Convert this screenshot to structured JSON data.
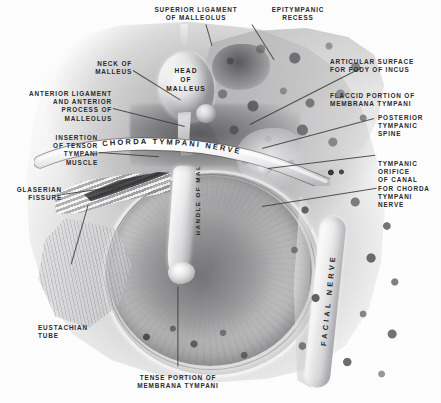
{
  "plate": {
    "title": "Tympanic membrane and ossicles — inner view of right tympanic cavity",
    "medium": "grayscale anatomical engraving",
    "width": 441,
    "height": 403,
    "background_color": "#ffffff",
    "label_color": "#2b2b2b",
    "leader_color": "#3a3a3a"
  },
  "labels": [
    {
      "id": "superior-ligament-of-malleolus",
      "text": "SUPERIOR LIGAMENT\nOF MALLEOLUS",
      "align": "center"
    },
    {
      "id": "epitympanic-recess",
      "text": "EPITYMPANIC\nRECESS",
      "align": "center"
    },
    {
      "id": "neck-of-malleus",
      "text": "NECK OF\nMALLEUS",
      "align": "right"
    },
    {
      "id": "anterior-ligament-and-anterior-process-of-malleolus",
      "text": "ANTERIOR LIGAMENT\nAND ANTERIOR\nPROCESS OF\nMALLEOLUS",
      "align": "right"
    },
    {
      "id": "insertion-of-tensor-tympani-muscle",
      "text": "INSERTION\nOF TENSOR\nTYMPANI\nMUSCLE",
      "align": "right"
    },
    {
      "id": "glaserian-fissure",
      "text": "GLASERIAN\nFISSURE",
      "align": "right"
    },
    {
      "id": "eustachian-tube",
      "text": "EUSTACHIAN\nTUBE",
      "align": "left"
    },
    {
      "id": "tense-portion-of-membrana-tympani",
      "text": "TENSE PORTION OF\nMEMBRANA TYMPANI",
      "align": "center"
    },
    {
      "id": "articular-surface-for-body-of-incus",
      "text": "ARTICULAR SURFACE\nFOR FODY OF INCUS",
      "align": "left"
    },
    {
      "id": "flaccid-portion-of-membrana-tympani",
      "text": "FLACCID PORTION OF\nMEMBRANA TYMPANI",
      "align": "left"
    },
    {
      "id": "posterior-tympanic-spine",
      "text": "POSTERIOR\nTYMPANIC\nSPINE",
      "align": "left"
    },
    {
      "id": "tympanic-orifice-of-canal-for-chorda-tympani-nerve",
      "text": "TYMPANIC\nORIFICE\nOF CANAL\nFOR CHORDA\nTYMPANI\nNERVE",
      "align": "left"
    }
  ],
  "in_figure_text": [
    {
      "id": "head-of-malleus",
      "text": "HEAD\nOF\nMALLEUS"
    },
    {
      "id": "chorda-tympani-nerve",
      "text": "CHORDA TYMPANI NERVE"
    },
    {
      "id": "handle-of-malleus",
      "text": "HANDLE OF MAL"
    },
    {
      "id": "facial-nerve",
      "text": "FACIAL NERVE"
    }
  ],
  "structures": [
    {
      "id": "tympanic-membrane",
      "name": "tympanic membrane"
    },
    {
      "id": "malleus-head",
      "name": "head of malleus"
    },
    {
      "id": "malleus-neck",
      "name": "neck of malleus"
    },
    {
      "id": "manubrium",
      "name": "handle of malleus"
    },
    {
      "id": "chorda-tympani-band",
      "name": "chorda tympani nerve"
    },
    {
      "id": "facial-nerve-canal",
      "name": "facial nerve"
    },
    {
      "id": "eustachian-tube",
      "name": "eustachian tube"
    },
    {
      "id": "petrous-bone-block",
      "name": "temporal bone"
    },
    {
      "id": "glaserian-fissure",
      "name": "glaserian fissure"
    },
    {
      "id": "tensor-tympani-tendon",
      "name": "tensor tympani tendon"
    }
  ]
}
